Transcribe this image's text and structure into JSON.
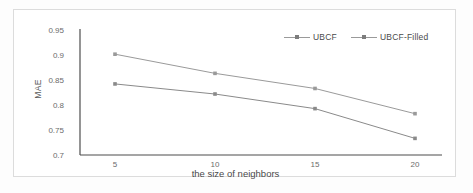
{
  "chart_data": {
    "type": "line",
    "title": "",
    "xlabel": "the size of neighbors",
    "ylabel": "MAE",
    "categories": [
      "5",
      "10",
      "15",
      "20"
    ],
    "x": [
      5,
      10,
      15,
      20
    ],
    "xticklabels": [
      "5",
      "10",
      "15",
      "20"
    ],
    "yticklabels": [
      "0.95",
      "0.9",
      "0.85",
      "0.8",
      "0.75",
      "0.7"
    ],
    "yticks": [
      0.95,
      0.9,
      0.85,
      0.8,
      0.75,
      0.7
    ],
    "ylim": [
      0.7,
      0.95
    ],
    "xlim": [
      0,
      22.5
    ],
    "grid": false,
    "legend_position": "top-right",
    "series": [
      {
        "name": "UBCF",
        "values": [
          0.9,
          0.862,
          0.832,
          0.782
        ],
        "color": "#9a9a9a",
        "marker": "square"
      },
      {
        "name": "UBCF-Filled",
        "values": [
          0.841,
          0.821,
          0.792,
          0.733
        ],
        "color": "#8a8a8a",
        "marker": "square"
      }
    ]
  },
  "legend": {
    "items": [
      {
        "label": "UBCF"
      },
      {
        "label": "UBCF-Filled"
      }
    ]
  },
  "axes": {
    "y_label": "MAE",
    "x_label": "the size of neighbors",
    "y_ticks": [
      "0.95",
      "0.9",
      "0.85",
      "0.8",
      "0.75",
      "0.7"
    ],
    "x_ticks": [
      "5",
      "10",
      "15",
      "20"
    ]
  },
  "colors": {
    "axis": "#4d4d4d",
    "series_1": "#9a9a9a",
    "series_2": "#8a8a8a",
    "frame": "#dcdcdc",
    "text": "#5a5a5a"
  }
}
